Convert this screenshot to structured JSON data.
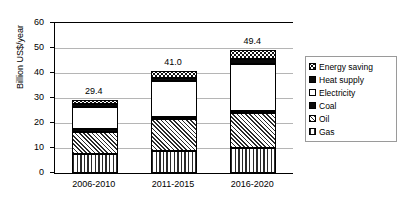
{
  "chart_data": {
    "type": "bar",
    "subtype": "stacked-bar",
    "title": "",
    "xlabel": "",
    "ylabel": "Billion US$/year",
    "categories": [
      "2006-2010",
      "2011-2015",
      "2016-2020"
    ],
    "ylim": [
      0,
      60
    ],
    "yticks": [
      0,
      10,
      20,
      30,
      40,
      50,
      60
    ],
    "ytick_labels": [
      "0",
      "10",
      "20",
      "30",
      "40",
      "50",
      "60"
    ],
    "grid": true,
    "grid_axis": "y",
    "legend_position": "right",
    "stack_order_bottom_to_top": [
      "Gas",
      "Oil",
      "Coal",
      "Electricity",
      "Heat supply",
      "Energy saving"
    ],
    "series": [
      {
        "name": "Gas",
        "pattern": "vertical-stripes",
        "values": [
          7.5,
          9.0,
          10.0
        ]
      },
      {
        "name": "Oil",
        "pattern": "diagonal-hatch",
        "values": [
          9.0,
          12.5,
          14.0
        ]
      },
      {
        "name": "Coal",
        "pattern": "solid-black",
        "values": [
          1.0,
          1.0,
          1.0
        ]
      },
      {
        "name": "Electricity",
        "pattern": "solid-white",
        "values": [
          9.0,
          14.5,
          18.5
        ]
      },
      {
        "name": "Heat supply",
        "pattern": "solid-black",
        "values": [
          1.0,
          1.0,
          2.0
        ]
      },
      {
        "name": "Energy saving",
        "pattern": "checker-dots",
        "values": [
          1.9,
          3.0,
          3.9
        ]
      }
    ],
    "totals": [
      29.4,
      41.0,
      49.4
    ],
    "total_labels": [
      "29.4",
      "41.0",
      "49.4"
    ]
  },
  "legend": {
    "items": [
      {
        "label": "Energy saving",
        "pattern": "checker-dots"
      },
      {
        "label": "Heat supply",
        "pattern": "solid-black"
      },
      {
        "label": "Electricity",
        "pattern": "solid-white"
      },
      {
        "label": "Coal",
        "pattern": "solid-black"
      },
      {
        "label": "Oil",
        "pattern": "diagonal-hatch"
      },
      {
        "label": "Gas",
        "pattern": "vertical-stripes"
      }
    ]
  },
  "colors": {
    "axis": "#000000",
    "gridline": "#b5b5b5",
    "text": "#000000",
    "background": "#ffffff",
    "pattern_dark": "#2a2a2a"
  }
}
